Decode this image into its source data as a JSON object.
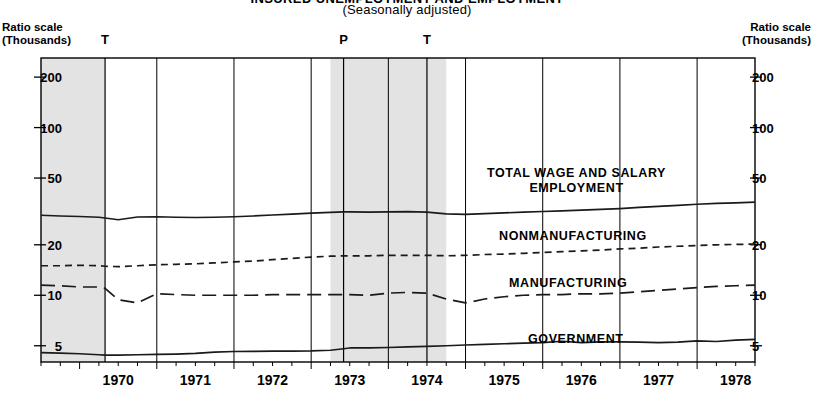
{
  "title": "INSURED UNEMPLOYMENT AND EMPLOYMENT",
  "subtitle": "(Seasonally adjusted)",
  "axis": {
    "left_caption_line1": "Ratio scale",
    "left_caption_line2": "(Thousands)",
    "right_caption_line1": "Ratio scale",
    "right_caption_line2": "(Thousands)"
  },
  "markers": [
    {
      "label": "T",
      "x_year": 1970.33
    },
    {
      "label": "P",
      "x_year": 1973.42
    },
    {
      "label": "T",
      "x_year": 1974.5
    }
  ],
  "recession_bands": [
    {
      "start": 1969.5,
      "end": 1970.33
    },
    {
      "start": 1973.25,
      "end": 1974.75
    }
  ],
  "series_labels": [
    {
      "name": "total",
      "line1": "TOTAL WAGE AND SALARY",
      "line2": "EMPLOYMENT"
    },
    {
      "name": "nonmanufacturing",
      "line1": "NONMANUFACTURING",
      "line2": ""
    },
    {
      "name": "manufacturing",
      "line1": "MANUFACTURING",
      "line2": ""
    },
    {
      "name": "government",
      "line1": "GOVERNMENT",
      "line2": ""
    }
  ],
  "chart_data": {
    "type": "line",
    "title": "INSURED UNEMPLOYMENT AND EMPLOYMENT",
    "subtitle": "(Seasonally adjusted)",
    "xlabel": "",
    "ylabel": "Ratio scale (Thousands)",
    "yscale": "log",
    "ylim": [
      4.0,
      260
    ],
    "xlim": [
      1969.5,
      1978.75
    ],
    "grid": false,
    "legend_position": "inline-right",
    "yticks": [
      200,
      100,
      50,
      20,
      10,
      5
    ],
    "ytick_labels": [
      "200",
      "100",
      "50",
      "20",
      "10",
      "5"
    ],
    "xticks": [
      1970,
      1971,
      1972,
      1973,
      1974,
      1975,
      1976,
      1977,
      1978
    ],
    "xtick_labels": [
      "1970",
      "1971",
      "1972",
      "1973",
      "1974",
      "1975",
      "1976",
      "1977",
      "1978"
    ],
    "x": [
      1969.5,
      1969.75,
      1970.0,
      1970.25,
      1970.33,
      1970.5,
      1970.75,
      1971.0,
      1971.25,
      1971.5,
      1971.75,
      1972.0,
      1972.25,
      1972.5,
      1972.75,
      1973.0,
      1973.25,
      1973.42,
      1973.5,
      1973.75,
      1974.0,
      1974.25,
      1974.5,
      1974.75,
      1975.0,
      1975.25,
      1975.5,
      1975.75,
      1976.0,
      1976.25,
      1976.5,
      1976.75,
      1977.0,
      1977.25,
      1977.5,
      1977.75,
      1978.0,
      1978.25,
      1978.5,
      1978.75
    ],
    "series": [
      {
        "name": "TOTAL WAGE AND SALARY EMPLOYMENT",
        "style": "solid",
        "values": [
          30.0,
          29.7,
          29.5,
          29.2,
          28.9,
          28.2,
          29.3,
          29.4,
          29.2,
          29.1,
          29.2,
          29.4,
          29.7,
          30.1,
          30.5,
          30.9,
          31.2,
          31.4,
          31.4,
          31.3,
          31.4,
          31.5,
          31.3,
          30.6,
          30.4,
          30.7,
          31.0,
          31.3,
          31.6,
          31.9,
          32.2,
          32.5,
          32.9,
          33.4,
          33.9,
          34.4,
          34.9,
          35.3,
          35.6,
          35.9
        ]
      },
      {
        "name": "NONMANUFACTURING",
        "style": "dashed-short",
        "values": [
          15.0,
          15.0,
          15.1,
          15.0,
          14.9,
          14.8,
          15.0,
          15.2,
          15.3,
          15.4,
          15.6,
          15.8,
          16.0,
          16.3,
          16.6,
          16.9,
          17.1,
          17.2,
          17.2,
          17.2,
          17.3,
          17.3,
          17.3,
          17.2,
          17.3,
          17.5,
          17.6,
          17.8,
          18.0,
          18.2,
          18.4,
          18.6,
          18.9,
          19.1,
          19.4,
          19.6,
          19.8,
          20.0,
          20.1,
          20.2
        ]
      },
      {
        "name": "MANUFACTURING",
        "style": "dashed-long",
        "values": [
          11.5,
          11.4,
          11.2,
          11.2,
          11.0,
          9.4,
          9.0,
          10.2,
          10.1,
          10.0,
          10.0,
          10.0,
          10.0,
          10.1,
          10.1,
          10.1,
          10.1,
          10.1,
          10.1,
          10.0,
          10.3,
          10.4,
          10.3,
          9.5,
          9.0,
          9.5,
          9.8,
          10.0,
          10.1,
          10.1,
          10.2,
          10.2,
          10.3,
          10.5,
          10.7,
          10.9,
          11.1,
          11.3,
          11.4,
          11.5
        ]
      },
      {
        "name": "GOVERNMENT",
        "style": "solid",
        "values": [
          4.55,
          4.52,
          4.48,
          4.42,
          4.4,
          4.4,
          4.42,
          4.44,
          4.46,
          4.5,
          4.58,
          4.62,
          4.63,
          4.64,
          4.65,
          4.66,
          4.7,
          4.8,
          4.85,
          4.85,
          4.88,
          4.92,
          4.96,
          5.0,
          5.05,
          5.1,
          5.14,
          5.18,
          5.22,
          5.32,
          5.22,
          5.28,
          5.28,
          5.26,
          5.22,
          5.26,
          5.34,
          5.3,
          5.4,
          5.45
        ]
      }
    ]
  }
}
